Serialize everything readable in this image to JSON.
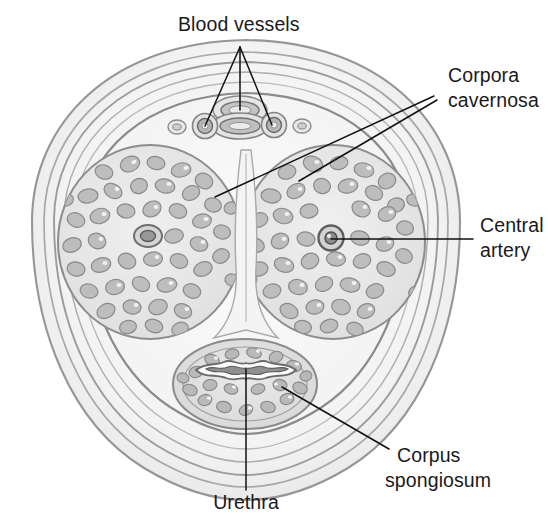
{
  "figure": {
    "type": "anatomical-illustration",
    "background_color": "#ffffff",
    "ink_color": "#111111",
    "width": 548,
    "height": 514
  },
  "labels": [
    {
      "id": "blood-vessels",
      "text": "Blood vessels",
      "line1": "Blood vessels",
      "line2": "",
      "x": 178,
      "y": 31,
      "anchor": "start"
    },
    {
      "id": "corpora-cavernosa",
      "text": "Corpora cavernosa",
      "line1": "Corpora",
      "line2": "cavernosa",
      "x": 448,
      "y": 82,
      "anchor": "start"
    },
    {
      "id": "central-artery",
      "text": "Central artery",
      "line1": "Central",
      "line2": "artery",
      "x": 480,
      "y": 232,
      "anchor": "start"
    },
    {
      "id": "corpus-spongiosum",
      "text": "Corpus spongiosum",
      "line1": "Corpus",
      "line2": "spongiosum",
      "x": 397,
      "y": 462,
      "anchor": "start"
    },
    {
      "id": "urethra",
      "text": "Urethra",
      "line1": "Urethra",
      "line2": "",
      "x": 246,
      "y": 509,
      "anchor": "middle"
    }
  ],
  "structures": [
    {
      "id": "skin-and-fascia",
      "name": "Skin and fascial layers",
      "shade": "#e9e9e9"
    },
    {
      "id": "tunica-albuginea",
      "name": "Tunica albuginea",
      "shade": "#d6d6d6"
    },
    {
      "id": "corpus-cavernosum-left",
      "name": "Left corpus cavernosum",
      "shade": "#e2e2e2"
    },
    {
      "id": "corpus-cavernosum-right",
      "name": "Right corpus cavernosum",
      "shade": "#e2e2e2"
    },
    {
      "id": "corpus-spongiosum",
      "name": "Corpus spongiosum",
      "shade": "#dcdcdc"
    },
    {
      "id": "urethra-lumen",
      "name": "Urethral lumen",
      "shade": "#f3f3f3"
    },
    {
      "id": "septum-penis",
      "name": "Septum penis",
      "shade": "#f0f0f0"
    },
    {
      "id": "deep-dorsal-vein",
      "name": "Deep dorsal vein",
      "shade": "#c9c9c9"
    },
    {
      "id": "dorsal-artery-left",
      "name": "Left dorsal artery",
      "shade": "#bdbdbd"
    },
    {
      "id": "dorsal-artery-right",
      "name": "Right dorsal artery",
      "shade": "#bdbdbd"
    },
    {
      "id": "superficial-dorsal-vein-left",
      "name": "Left superficial dorsal vein",
      "shade": "#d2d2d2"
    },
    {
      "id": "superficial-dorsal-vein-right",
      "name": "Right superficial dorsal vein",
      "shade": "#d2d2d2"
    },
    {
      "id": "central-artery-left",
      "name": "Left central (deep) artery",
      "shade": "#9a9a9a"
    },
    {
      "id": "central-artery-right",
      "name": "Right central (deep) artery",
      "shade": "#9a9a9a"
    }
  ],
  "leader_lines": [
    {
      "id": "blood-vessels-center",
      "from": [
        240,
        47
      ],
      "to": [
        240,
        110
      ]
    },
    {
      "id": "blood-vessels-left",
      "from": [
        240,
        47
      ],
      "to": [
        205,
        126
      ]
    },
    {
      "id": "blood-vessels-right",
      "from": [
        240,
        47
      ],
      "to": [
        272,
        125
      ]
    },
    {
      "id": "corpora-cavernosa-left",
      "from": [
        434,
        96
      ],
      "to": [
        215,
        197
      ]
    },
    {
      "id": "corpora-cavernosa-right",
      "from": [
        437,
        100
      ],
      "to": [
        299,
        181
      ]
    },
    {
      "id": "central-artery-leader",
      "from": [
        473,
        239
      ],
      "to": [
        331,
        239
      ]
    },
    {
      "id": "corpus-spongiosum-leader",
      "from": [
        389,
        449
      ],
      "to": [
        282,
        387
      ]
    },
    {
      "id": "urethra-leader",
      "from": [
        246,
        490
      ],
      "to": [
        246,
        369
      ]
    }
  ]
}
